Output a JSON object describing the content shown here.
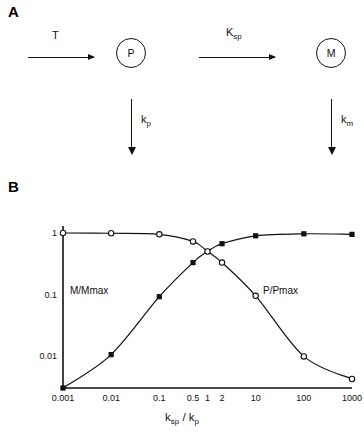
{
  "figure": {
    "panel_a_letter": "A",
    "panel_b_letter": "B"
  },
  "panel_a": {
    "arrow1_label": "T",
    "node1_label": "P",
    "arrow2_label_main": "K",
    "arrow2_label_sub": "sp",
    "node2_label": "M",
    "down1_label_main": "k",
    "down1_label_sub": "p",
    "down2_label_main": "k",
    "down2_label_sub": "m"
  },
  "panel_b": {
    "x_axis_title_main1": "k",
    "x_axis_title_sub1": "sp",
    "x_axis_title_sep": " / ",
    "x_axis_title_main2": "k",
    "x_axis_title_sub2": "p",
    "curve_label_left": "M/Mmax",
    "curve_label_right": "P/Pmax"
  },
  "chart_data": {
    "type": "line",
    "title": "",
    "xlabel": "ksp / kp",
    "ylabel": "",
    "xscale": "log",
    "yscale": "log",
    "xlim": [
      0.001,
      1000
    ],
    "ylim": [
      0.003,
      1.3
    ],
    "x_tick_labels": [
      "0.001",
      "0.01",
      "0.1",
      "0.5",
      "1",
      "2",
      "10",
      "100",
      "1000"
    ],
    "x_tick_values": [
      0.001,
      0.01,
      0.1,
      0.5,
      1,
      2,
      10,
      100,
      1000
    ],
    "y_tick_labels": [
      "1",
      "0.1",
      "0.01"
    ],
    "y_tick_values": [
      1,
      0.1,
      0.01
    ],
    "grid": false,
    "legend": "inline-annotations",
    "series": [
      {
        "name": "M/Mmax",
        "marker": "filled-square",
        "x": [
          0.001,
          0.01,
          0.1,
          0.5,
          1,
          2,
          10,
          100,
          1000
        ],
        "y": [
          0.003,
          0.0105,
          0.092,
          0.33,
          0.5,
          0.67,
          0.9,
          0.97,
          0.95
        ]
      },
      {
        "name": "P/Pmax",
        "marker": "open-circle",
        "x": [
          0.001,
          0.01,
          0.1,
          0.5,
          1,
          2,
          10,
          100,
          1000
        ],
        "y": [
          1.0,
          0.99,
          0.95,
          0.73,
          0.5,
          0.33,
          0.095,
          0.0098,
          0.0042
        ]
      }
    ]
  }
}
